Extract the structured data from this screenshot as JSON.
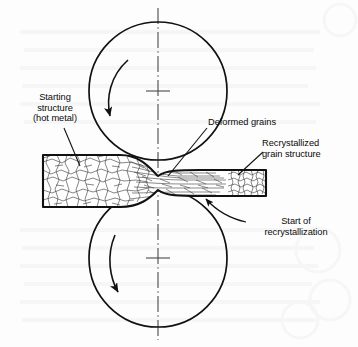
{
  "figure": {
    "background_color": "#fdfdfd",
    "line_color": "#111111",
    "text_color": "#0a0a0a"
  },
  "labels": {
    "starting_structure": "Starting\nstructure\n(hot metal)",
    "deformed_grains": "Deformed grains",
    "recrystallized_grain_structure": "Recrystallized\ngrain structure",
    "start_of_recrystallization": "Start of\nrecrystallization"
  },
  "diagram": {
    "upper_roll": {
      "name": "upper-roll",
      "center_x": 158,
      "center_y": 91,
      "radius": 69,
      "rotation": "counterclockwise"
    },
    "lower_roll": {
      "name": "lower-roll",
      "center_x": 158,
      "center_y": 258,
      "radius": 69,
      "rotation": "counterclockwise"
    },
    "centerline": {
      "name": "vertical-centerline",
      "x": 158,
      "y_top": 8,
      "y_bottom": 340,
      "style": "dash-dot"
    },
    "workpiece": {
      "name": "metal-slab",
      "entry_left_x": 43,
      "entry_top_y": 155,
      "entry_bottom_y": 207,
      "exit_right_x": 266,
      "exit_top_y": 170,
      "exit_bottom_y": 196,
      "zones": [
        "starting equiaxed grains",
        "deformed elongated grains",
        "recrystallized fine grains"
      ]
    }
  }
}
